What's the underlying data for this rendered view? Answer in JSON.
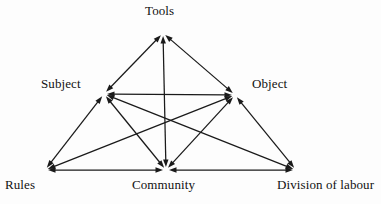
{
  "diagram": {
    "type": "node-link-diagram",
    "background_color": "#fdfdfd",
    "line_color": "#1a1a1a",
    "text_color": "#111111",
    "nodes": [
      {
        "id": "tools",
        "label": "Tools",
        "x": 163,
        "y": 33,
        "label_x": 145,
        "label_y": 4
      },
      {
        "id": "subject",
        "label": "Subject",
        "x": 104,
        "y": 94,
        "label_x": 41,
        "label_y": 77
      },
      {
        "id": "object",
        "label": "Object",
        "x": 235,
        "y": 95,
        "label_x": 252,
        "label_y": 77
      },
      {
        "id": "rules",
        "label": "Rules",
        "x": 45,
        "y": 170,
        "label_x": 5,
        "label_y": 178
      },
      {
        "id": "community",
        "label": "Community",
        "x": 166,
        "y": 170,
        "label_x": 132,
        "label_y": 178
      },
      {
        "id": "division",
        "label": "Division of labour",
        "x": 296,
        "y": 170,
        "label_x": 277,
        "label_y": 178
      }
    ],
    "edges": [
      {
        "from": "subject",
        "to": "tools",
        "arrows": "both",
        "kind": "outer-left"
      },
      {
        "from": "tools",
        "to": "object",
        "arrows": "both",
        "kind": "outer-right"
      },
      {
        "from": "subject",
        "to": "object",
        "arrows": "both",
        "kind": "upper-horizontal"
      },
      {
        "from": "tools",
        "to": "community",
        "arrows": "both",
        "kind": "vertical-center"
      },
      {
        "from": "subject",
        "to": "rules",
        "arrows": "both",
        "kind": "outer-lower-left"
      },
      {
        "from": "object",
        "to": "division",
        "arrows": "both",
        "kind": "outer-lower-right"
      },
      {
        "from": "rules",
        "to": "community",
        "arrows": "both",
        "kind": "bottom-left"
      },
      {
        "from": "community",
        "to": "division",
        "arrows": "both",
        "kind": "bottom-right"
      },
      {
        "from": "subject",
        "to": "community",
        "arrows": "both",
        "kind": "inner-diagonal"
      },
      {
        "from": "object",
        "to": "community",
        "arrows": "both",
        "kind": "inner-diagonal"
      },
      {
        "from": "subject",
        "to": "division",
        "arrows": "both",
        "kind": "cross-diagonal"
      },
      {
        "from": "object",
        "to": "rules",
        "arrows": "both",
        "kind": "cross-diagonal"
      }
    ],
    "arrowhead": {
      "name": "solid-triangle-arrowhead",
      "length": 7.5,
      "width": 5.4
    }
  }
}
